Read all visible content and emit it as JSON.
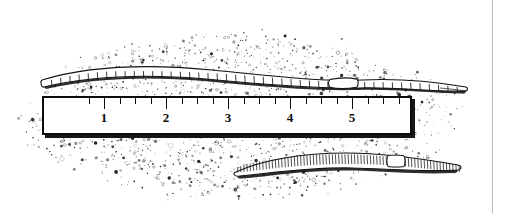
{
  "figure": {
    "kind": "scanned-line-illustration",
    "background_color": "#ffffff",
    "ink_color": "#101010",
    "page_rule_color": "#b9b9b9",
    "page_rule_x": 492
  },
  "soil": {
    "name": "stippled soil field",
    "x": 10,
    "y": 28,
    "width": 460,
    "height": 177,
    "speck_color": "#1a1a1a",
    "speck_count": 2600
  },
  "ruler": {
    "name": "measuring ruler",
    "x": 42,
    "y": 96,
    "width": 370,
    "height": 39,
    "face_color": "#ffffff",
    "border_color": "#0c0c0c",
    "shadow_color": "#161616",
    "unit_px": 62,
    "origin_px": 42,
    "labels": [
      "1",
      "2",
      "3",
      "4",
      "5"
    ],
    "label_positions": [
      104,
      166,
      228,
      290,
      352
    ],
    "minor_ticks_per_unit": 4,
    "major_tick_height": 11,
    "minor_tick_height": 6
  },
  "worms": [
    {
      "id": "top-worm",
      "name": "upper earthworm",
      "x_start": 42,
      "x_end": 466,
      "y_center": 80,
      "body_height": 13,
      "segment_count": 46,
      "segmentation": "coarse",
      "clitellum": {
        "x_start": 330,
        "x_end": 356,
        "label": "clitellum"
      },
      "posture": "gently undulating, thinning to a point at the right tail"
    },
    {
      "id": "bottom-worm",
      "name": "lower earthworm",
      "x_start": 234,
      "x_end": 462,
      "y_center": 165,
      "body_height": 12,
      "segment_count": 72,
      "segmentation": "fine",
      "clitellum": {
        "x_start": 388,
        "x_end": 404,
        "label": "clitellum"
      },
      "posture": "slightly arched, tapering at both ends"
    }
  ]
}
